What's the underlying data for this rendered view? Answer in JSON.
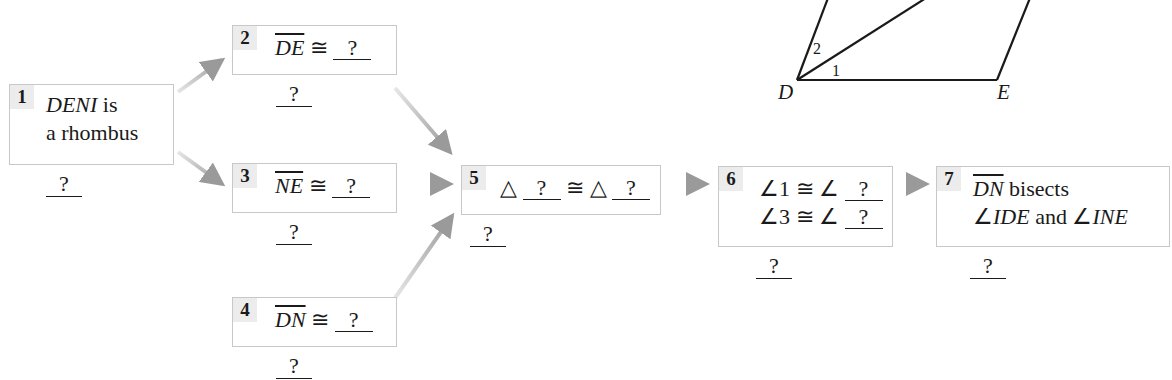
{
  "diagram": {
    "type": "flow-proof",
    "figure": {
      "name": "rhombus DENI (partial view)",
      "vertex_labels": {
        "D": "D",
        "E": "E"
      },
      "angle_labels": {
        "one": "1",
        "two": "2"
      }
    },
    "steps": [
      {
        "number": "1",
        "statement_parts": [
          "DENI",
          " is",
          "a rhombus"
        ],
        "reason": "?"
      },
      {
        "number": "2",
        "segment": "DE",
        "congruent": "≅",
        "blank": "?",
        "reason": "?"
      },
      {
        "number": "3",
        "segment": "NE",
        "congruent": "≅",
        "blank": "?",
        "reason": "?"
      },
      {
        "number": "4",
        "segment": "DN",
        "congruent": "≅",
        "blank": "?",
        "reason": "?"
      },
      {
        "number": "5",
        "triangle": "△",
        "congruent": "≅",
        "blank1": "?",
        "blank2": "?",
        "reason": "?"
      },
      {
        "number": "6",
        "line1_prefix": "∠1 ≅ ∠",
        "line1_blank": "?",
        "line2_prefix": "∠3 ≅ ∠",
        "line2_blank": "?",
        "reason": "?"
      },
      {
        "number": "7",
        "segment": "DN",
        "line1_rest": " bisects",
        "angle": "∠",
        "angle1": "IDE",
        "and": " and ",
        "angle2": "INE",
        "reason": "?"
      }
    ],
    "arrows": [
      {
        "from": "1",
        "to": "2"
      },
      {
        "from": "1",
        "to": "3"
      },
      {
        "from": "2",
        "to": "5"
      },
      {
        "from": "3",
        "to": "5"
      },
      {
        "from": "4",
        "to": "5"
      },
      {
        "from": "5",
        "to": "6"
      },
      {
        "from": "6",
        "to": "7"
      }
    ],
    "colors": {
      "box_border": "#c8c8c8",
      "number_bg": "#ececec",
      "arrow": "#a0a0a0",
      "text": "#1a1a1a"
    }
  }
}
